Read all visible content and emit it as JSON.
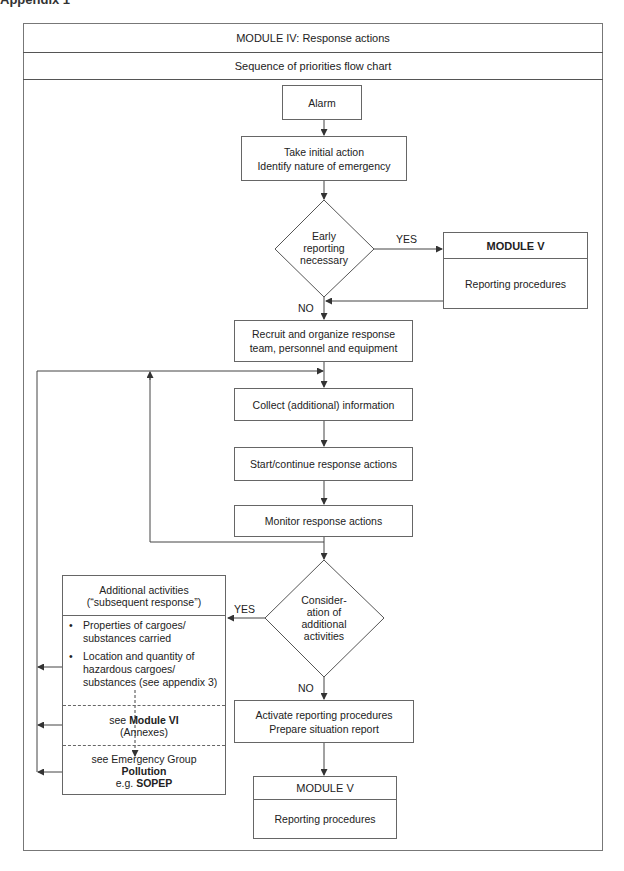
{
  "page_heading_cut": "Appendix 1",
  "header": {
    "title": "MODULE IV: Response actions",
    "subtitle": "Sequence of priorities flow chart"
  },
  "flow": {
    "alarm": "Alarm",
    "initial_action": {
      "line1": "Take initial action",
      "line2": "Identify nature of emergency"
    },
    "decision_early_reporting": {
      "line1": "Early",
      "line2": "reporting",
      "line3": "necessary",
      "yes_label": "YES",
      "no_label": "NO"
    },
    "module_v_right": {
      "title": "MODULE V",
      "body": "Reporting procedures"
    },
    "recruit": {
      "line1": "Recruit and organize response",
      "line2": "team, personnel and equipment"
    },
    "collect": "Collect (additional) information",
    "start_continue": "Start/continue response actions",
    "monitor": "Monitor response actions",
    "decision_additional": {
      "line1": "Consider-",
      "line2": "ation of",
      "line3": "additional",
      "line4": "activities",
      "yes_label": "YES",
      "no_label": "NO"
    },
    "additional_activities": {
      "title_line1": "Additional activities",
      "title_line2": "(“subsequent response”)",
      "bullets": [
        "Properties of cargoes/ substances carried",
        "Location and quantity of hazardous cargoes/ substances (see appendix 3)"
      ],
      "module_vi": {
        "prefix": "see ",
        "bold": "Module VI",
        "line2": "(Annexes)"
      },
      "emergency_group": {
        "line1": "see Emergency Group",
        "line2_bold": "Pollution",
        "line3_prefix": "e.g. ",
        "line3_bold": "SOPEP"
      }
    },
    "activate": {
      "line1": "Activate reporting procedures",
      "line2": "Prepare situation report"
    },
    "module_v_bottom": {
      "title": "MODULE V",
      "body": "Reporting procedures"
    }
  },
  "colors": {
    "line": "#444444",
    "border": "#666666",
    "text": "#222222",
    "background": "#ffffff"
  }
}
